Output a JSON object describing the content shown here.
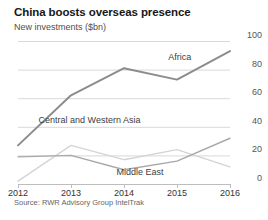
{
  "header": {
    "title": "China boosts overseas presence",
    "subtitle": "New investments ($bn)"
  },
  "source": {
    "text": "Source: RWR Advisory Group IntelTrak"
  },
  "colors": {
    "africa": "#8c8c8c",
    "central_western_asia": "#d4d4d4",
    "middle_east": "#a8a8a8",
    "gridline": "#d9d9d9",
    "axis": "#bdbdbd",
    "title": "#171717",
    "subtitle": "#4d4d4d"
  },
  "chart_data": {
    "type": "line",
    "title": "China boosts overseas presence",
    "subtitle": "New investments ($bn)",
    "xlabel": "",
    "ylabel": "",
    "x": [
      2012,
      2013,
      2014,
      2015,
      2016
    ],
    "xticklabels": [
      "2012",
      "2013",
      "2014",
      "2015",
      "2016"
    ],
    "yticks": [
      0,
      20,
      40,
      60,
      80,
      100
    ],
    "yticklabels": [
      "0",
      "20",
      "40",
      "60",
      "80",
      "100"
    ],
    "ylim": [
      0,
      100
    ],
    "xlim": [
      2012,
      2016
    ],
    "grid": true,
    "legend": "inline-labels",
    "series": [
      {
        "name": "Africa",
        "color": "#8c8c8c",
        "values": [
          27,
          62,
          81,
          73,
          93
        ],
        "label_x": 2015.05,
        "label_y": 88
      },
      {
        "name": "Central and Western Asia",
        "color": "#d4d4d4",
        "values": [
          2,
          27,
          17,
          24,
          12
        ],
        "label_x": 2013.35,
        "label_y": 44
      },
      {
        "name": "Middle East",
        "color": "#a8a8a8",
        "values": [
          19,
          20,
          10,
          16,
          32
        ],
        "label_x": 2014.3,
        "label_y": 8
      }
    ]
  },
  "y_axis": {
    "ticks": [
      {
        "label": "100"
      },
      {
        "label": "80"
      },
      {
        "label": "60"
      },
      {
        "label": "40"
      },
      {
        "label": "20"
      },
      {
        "label": "0"
      }
    ]
  },
  "x_axis": {
    "ticks": [
      {
        "label": "2012"
      },
      {
        "label": "2013"
      },
      {
        "label": "2014"
      },
      {
        "label": "2015"
      },
      {
        "label": "2016"
      }
    ]
  }
}
